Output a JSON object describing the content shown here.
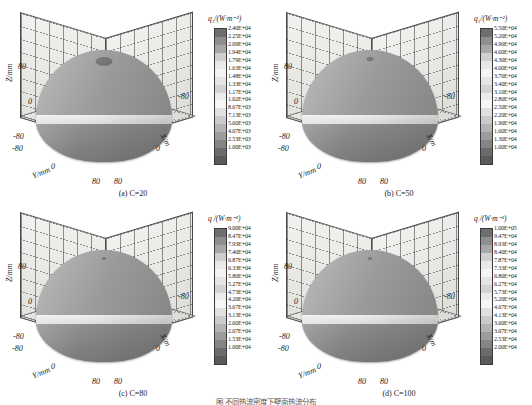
{
  "figure": {
    "caption": "图     不同热流密度下壁面热流分布",
    "axis": {
      "z_label": "Z/mm",
      "y_label": "Y/mm",
      "x_label": "X/m",
      "z_ticks": [
        "80",
        "0",
        "-80"
      ],
      "y_ticks": [
        "-80",
        "0",
        "80"
      ],
      "x_ticks": [
        "-80",
        "0",
        "80"
      ]
    }
  },
  "chart_data": {
    "type": "heatmap",
    "xlabel": "X/m",
    "ylabel": "Y/mm",
    "zlabel": "Z/mm",
    "xlim": [
      -80,
      80
    ],
    "ylim": [
      -80,
      80
    ],
    "zlim": [
      -80,
      80
    ],
    "grid": true,
    "legend_position": "right",
    "colormap": "grayscale-discrete-17",
    "panels": [
      {
        "id": "a",
        "label": "(a) C=20",
        "param_name": "C",
        "param_value": 20,
        "colorbar_title": "q₁/(W·m⁻²)",
        "levels": [
          "2.40E+04",
          "2.25E+04",
          "2.09E+04",
          "1.94E+04",
          "1.79E+04",
          "1.63E+04",
          "1.48E+04",
          "1.33E+04",
          "1.17E+04",
          "1.02E+04",
          "8.67E+03",
          "7.13E+03",
          "5.60E+03",
          "4.07E+03",
          "2.53E+03",
          "1.00E+03"
        ],
        "level_values": [
          24000,
          22500,
          20900,
          19400,
          17900,
          16300,
          14800,
          13300,
          11700,
          10200,
          8670,
          7130,
          5600,
          4070,
          2530,
          1000
        ],
        "min": 1000,
        "max": 24000
      },
      {
        "id": "b",
        "label": "(b) C=50",
        "param_name": "C",
        "param_value": 50,
        "colorbar_title": "q₁/(W·m⁻²)",
        "levels": [
          "5.50E+04",
          "5.20E+04",
          "4.90E+04",
          "4.60E+04",
          "4.30E+04",
          "4.00E+04",
          "3.70E+04",
          "3.40E+04",
          "3.10E+04",
          "2.80E+04",
          "2.50E+04",
          "2.20E+04",
          "1.90E+04",
          "1.60E+04",
          "1.30E+04",
          "1.00E+04"
        ],
        "level_values": [
          55000,
          52000,
          49000,
          46000,
          43000,
          40000,
          37000,
          34000,
          31000,
          28000,
          25000,
          22000,
          19000,
          16000,
          13000,
          10000
        ],
        "min": 10000,
        "max": 55000
      },
      {
        "id": "c",
        "label": "(c) C=80",
        "param_name": "C",
        "param_value": 80,
        "colorbar_title": "q /(W·m⁻²)",
        "levels": [
          "9.00E+04",
          "8.47E+04",
          "7.93E+04",
          "7.40E+04",
          "6.87E+04",
          "6.33E+04",
          "5.80E+04",
          "5.27E+04",
          "4.73E+04",
          "4.20E+04",
          "3.67E+04",
          "3.13E+04",
          "2.60E+04",
          "2.07E+04",
          "1.53E+04",
          "1.00E+04"
        ],
        "level_values": [
          90000,
          84700,
          79300,
          74000,
          68700,
          63300,
          58000,
          52700,
          47300,
          42000,
          36700,
          31300,
          26000,
          20700,
          15300,
          10000
        ],
        "min": 10000,
        "max": 90000
      },
      {
        "id": "d",
        "label": "(d) C=100",
        "param_name": "C",
        "param_value": 100,
        "colorbar_title": "q /(W·m⁻²)",
        "levels": [
          "1.00E+05",
          "9.47E+04",
          "8.93E+04",
          "8.40E+04",
          "7.87E+04",
          "7.33E+04",
          "6.80E+04",
          "6.27E+04",
          "5.73E+04",
          "5.20E+04",
          "4.67E+04",
          "4.13E+04",
          "3.60E+04",
          "3.07E+04",
          "2.53E+04",
          "2.00E+04"
        ],
        "level_values": [
          100000,
          94700,
          89300,
          84000,
          78700,
          73300,
          68000,
          62700,
          57300,
          52000,
          46700,
          41300,
          36000,
          30700,
          25300,
          20000
        ],
        "min": 20000,
        "max": 100000
      }
    ],
    "swatch_colors": [
      "#6f6f6f",
      "#8f8f8f",
      "#a8a8a8",
      "#cfcfcf",
      "#e9e9e9",
      "#f4f4f4",
      "#e4e4e4",
      "#d3d3d3",
      "#ececec",
      "#f6f6f6",
      "#e0e0e0",
      "#cacaca",
      "#b4b4b4",
      "#9c9c9c",
      "#848484",
      "#6b6b6b",
      "#5a5a5a"
    ]
  }
}
